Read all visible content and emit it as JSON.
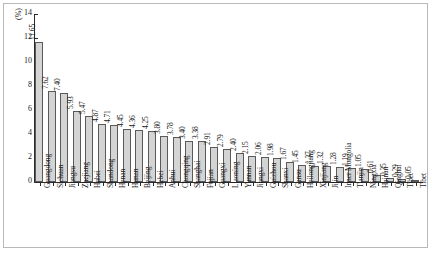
{
  "chart_data": {
    "type": "bar",
    "title": "",
    "subtitle": "",
    "xlabel": "",
    "ylabel": "(%)",
    "ylim": [
      0,
      14
    ],
    "ytick_values": [
      0,
      2,
      4,
      6,
      8,
      10,
      12,
      14
    ],
    "ytick_labels": [
      "0",
      "2",
      "4",
      "6",
      "8",
      "10",
      "12",
      "14"
    ],
    "grid": false,
    "legend": null,
    "orientation": "vertical",
    "bar_value_labels": true,
    "categories": [
      "Guangdong",
      "Sichuan",
      "Jiangsu",
      "Zhejiang",
      "Hubei",
      "Shandong",
      "Henan",
      "Hunan",
      "Beijing",
      "Hebei",
      "Anhui",
      "Chongqing",
      "Shanghai",
      "Fujian",
      "Guangxi",
      "Liaoning",
      "Yunnan",
      "Jiangxi",
      "Guizhou",
      "Shanxi",
      "Gansu",
      "Heilongjiang",
      "Xinjiang",
      "Jilin",
      "Inner Mongolia",
      "Tianjin",
      "Ningxia",
      "Hainan",
      "Qinghai",
      "Tibet"
    ],
    "values": [
      11.65,
      7.62,
      7.4,
      5.93,
      5.47,
      4.87,
      4.71,
      4.45,
      4.36,
      4.25,
      3.8,
      3.78,
      3.4,
      3.38,
      2.91,
      2.79,
      2.4,
      2.15,
      2.06,
      1.98,
      1.67,
      1.45,
      1.37,
      1.32,
      1.28,
      1.19,
      1.05,
      0.61,
      0.35,
      0.29
    ],
    "value_labels": [
      "11.65",
      "7.62",
      "7.40",
      "5.93",
      "5.47",
      "4.87",
      "4.71",
      "4.45",
      "4.36",
      "4.25",
      "3.80",
      "3.78",
      "3.40",
      "3.38",
      "2.91",
      "2.79",
      "2.40",
      "2.15",
      "2.06",
      "1.98",
      "1.67",
      "1.45",
      "1.37",
      "1.32",
      "1.28",
      "1.19",
      "1.05",
      "0.61",
      "0.35",
      "0.29"
    ],
    "extra_category": "Tibet",
    "extra_value": 0.05,
    "extra_value_label": "0.05",
    "colors": {
      "bar_fill": "#d4d4d4",
      "bar_stroke": "#5a5a5a",
      "axis": "#2b2b2b",
      "text": "#1a1a1a",
      "frame": "#b8b8b8",
      "background": "#ffffff"
    }
  }
}
